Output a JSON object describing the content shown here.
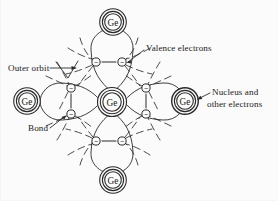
{
  "figure": {
    "type": "diagram",
    "background_color": "#fbfbfb",
    "ink_color": "#2a2a2a"
  },
  "atoms": [
    {
      "id": "center",
      "label": "Ge",
      "cx": 112,
      "cy": 102,
      "r_outer": 14.5,
      "r_inner": 11.5,
      "r_core": 9.0
    },
    {
      "id": "top",
      "label": "Ge",
      "cx": 113,
      "cy": 22,
      "r_outer": 13.5,
      "r_inner": 10.5,
      "r_core": 8.2
    },
    {
      "id": "bottom",
      "label": "Ge",
      "cx": 113,
      "cy": 180,
      "r_outer": 13.5,
      "r_inner": 10.5,
      "r_core": 8.2
    },
    {
      "id": "left",
      "label": "Ge",
      "cx": 27,
      "cy": 101,
      "r_outer": 13.5,
      "r_inner": 10.5,
      "r_core": 8.2
    },
    {
      "id": "right",
      "label": "Ge",
      "cx": 185,
      "cy": 101,
      "r_outer": 13.5,
      "r_inner": 10.5,
      "r_core": 8.2
    }
  ],
  "electrons": [
    {
      "id": "top-left",
      "cx": 96,
      "cy": 62,
      "r": 4.0,
      "charge": "−"
    },
    {
      "id": "top-right",
      "cx": 122,
      "cy": 62,
      "r": 4.0,
      "charge": "−"
    },
    {
      "id": "bottom-left",
      "cx": 96,
      "cy": 141,
      "r": 4.0,
      "charge": "−"
    },
    {
      "id": "bottom-right",
      "cx": 122,
      "cy": 141,
      "r": 4.0,
      "charge": "−"
    },
    {
      "id": "left-upper",
      "cx": 71,
      "cy": 88,
      "r": 4.0,
      "charge": "−"
    },
    {
      "id": "left-lower",
      "cx": 71,
      "cy": 114,
      "r": 4.0,
      "charge": "−"
    },
    {
      "id": "right-upper",
      "cx": 146,
      "cy": 88,
      "r": 4.0,
      "charge": "−"
    },
    {
      "id": "right-lower",
      "cx": 146,
      "cy": 114,
      "r": 4.0,
      "charge": "−"
    }
  ],
  "annotations": [
    {
      "id": "valence-electrons",
      "text": "Valence electrons",
      "x": 146,
      "y": 51,
      "anchor": "start"
    },
    {
      "id": "outer-orbit",
      "text": "Outer orbit",
      "x": 8,
      "y": 71,
      "anchor": "start"
    },
    {
      "id": "bond",
      "text": "Bond",
      "x": 28,
      "y": 131,
      "anchor": "start"
    },
    {
      "id": "nucleus-line1",
      "text": "Nucleus and",
      "x": 212,
      "y": 95,
      "anchor": "start"
    },
    {
      "id": "nucleus-line2",
      "text": "other electrons",
      "x": 207,
      "y": 107,
      "anchor": "start"
    }
  ]
}
